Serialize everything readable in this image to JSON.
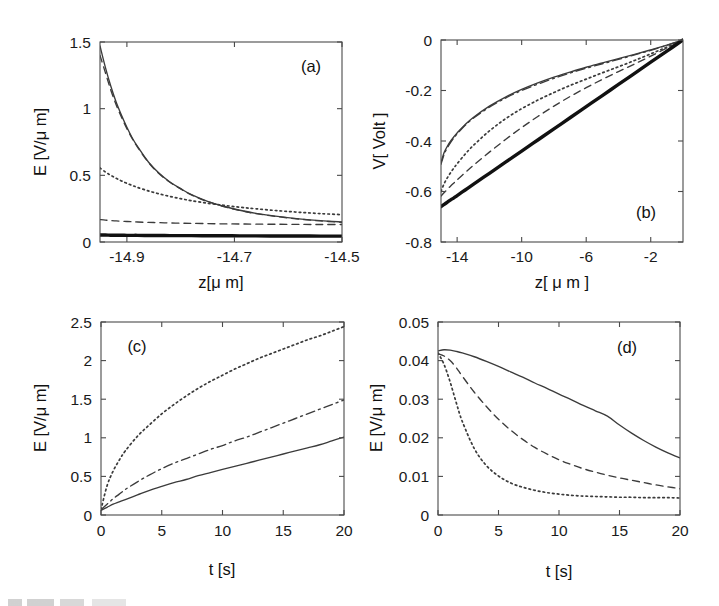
{
  "figure": {
    "background_color": "#ffffff",
    "line_color": "#3b3b3b",
    "panel_count": 4
  },
  "panels": {
    "a": {
      "tag": "(a)",
      "xlabel": "z[μ m]",
      "ylabel": "E [V/μ m]",
      "xticks": [
        "-14.9",
        "-14.7",
        "-14.5"
      ],
      "yticks": [
        "0",
        "0.5",
        "1",
        "1.5"
      ]
    },
    "b": {
      "tag": "(b)",
      "xlabel": "z[ μ m ]",
      "ylabel": "V[ Volt ]",
      "xticks": [
        "-14",
        "-10",
        "-6",
        "-2"
      ],
      "yticks": [
        "-0.8",
        "-0.6",
        "-0.4",
        "-0.2",
        "0"
      ]
    },
    "c": {
      "tag": "(c)",
      "xlabel": "t [s]",
      "ylabel": "E [V/μ m]",
      "xticks": [
        "0",
        "5",
        "10",
        "15",
        "20"
      ],
      "yticks": [
        "0",
        "0.5",
        "1",
        "1.5",
        "2",
        "2.5"
      ]
    },
    "d": {
      "tag": "(d)",
      "xlabel": "t [s]",
      "ylabel": "E [V/μ m]",
      "xticks": [
        "0",
        "5",
        "10",
        "15",
        "20"
      ],
      "yticks": [
        "0",
        "0.01",
        "0.02",
        "0.03",
        "0.04",
        "0.05"
      ]
    }
  },
  "chart_data": [
    {
      "panel": "a",
      "type": "line",
      "title": "(a)",
      "xlabel": "z[μ m]",
      "ylabel": "E [V/μ m]",
      "xlim": [
        -14.95,
        -14.5
      ],
      "ylim": [
        0,
        1.5
      ],
      "xticks": [
        -14.9,
        -14.7,
        -14.5
      ],
      "yticks": [
        0,
        0.5,
        1,
        1.5
      ],
      "grid": false,
      "legend": "none",
      "x": [
        -14.95,
        -14.94,
        -14.93,
        -14.92,
        -14.91,
        -14.9,
        -14.89,
        -14.88,
        -14.86,
        -14.84,
        -14.82,
        -14.8,
        -14.78,
        -14.75,
        -14.72,
        -14.69,
        -14.66,
        -14.62,
        -14.58,
        -14.54,
        -14.5
      ],
      "series": [
        {
          "name": "curve-1-solid",
          "style": "solid",
          "values": [
            1.47,
            1.31,
            1.17,
            1.05,
            0.95,
            0.86,
            0.78,
            0.715,
            0.6,
            0.515,
            0.45,
            0.4,
            0.355,
            0.305,
            0.268,
            0.238,
            0.215,
            0.192,
            0.174,
            0.16,
            0.15
          ]
        },
        {
          "name": "curve-2-dashed",
          "style": "dashed",
          "values": [
            1.4,
            1.27,
            1.14,
            1.03,
            0.935,
            0.85,
            0.775,
            0.71,
            0.597,
            0.512,
            0.448,
            0.398,
            0.353,
            0.303,
            0.266,
            0.236,
            0.213,
            0.19,
            0.172,
            0.158,
            0.148
          ]
        },
        {
          "name": "curve-3-dotted",
          "style": "dotted",
          "values": [
            0.555,
            0.525,
            0.5,
            0.478,
            0.458,
            0.44,
            0.424,
            0.409,
            0.383,
            0.361,
            0.342,
            0.325,
            0.31,
            0.291,
            0.275,
            0.261,
            0.249,
            0.235,
            0.223,
            0.213,
            0.205
          ]
        },
        {
          "name": "curve-4-dashed-low",
          "style": "dashed",
          "values": [
            0.168,
            0.164,
            0.161,
            0.158,
            0.156,
            0.154,
            0.152,
            0.15,
            0.147,
            0.145,
            0.143,
            0.141,
            0.14,
            0.138,
            0.136,
            0.135,
            0.134,
            0.133,
            0.132,
            0.131,
            0.131
          ]
        },
        {
          "name": "curve-5-thick-solid",
          "style": "thick",
          "values": [
            0.052,
            0.052,
            0.051,
            0.051,
            0.051,
            0.05,
            0.05,
            0.05,
            0.049,
            0.049,
            0.048,
            0.048,
            0.048,
            0.047,
            0.047,
            0.046,
            0.046,
            0.045,
            0.045,
            0.044,
            0.044
          ]
        }
      ]
    },
    {
      "panel": "b",
      "type": "line",
      "title": "(b)",
      "xlabel": "z[ μ m ]",
      "ylabel": "V[ Volt ]",
      "xlim": [
        -15,
        0
      ],
      "ylim": [
        -0.8,
        0
      ],
      "xticks": [
        -14,
        -10,
        -6,
        -2
      ],
      "yticks": [
        -0.8,
        -0.6,
        -0.4,
        -0.2,
        0
      ],
      "grid": false,
      "legend": "none",
      "x": [
        -15,
        -14.8,
        -14.6,
        -14.4,
        -14.2,
        -14,
        -13.5,
        -13,
        -12,
        -11,
        -10,
        -9,
        -8,
        -7,
        -6,
        -5,
        -4,
        -3,
        -2,
        -1,
        0
      ],
      "series": [
        {
          "name": "curve-1-solid",
          "style": "solid",
          "values": [
            -0.485,
            -0.445,
            -0.42,
            -0.4,
            -0.383,
            -0.368,
            -0.335,
            -0.307,
            -0.262,
            -0.226,
            -0.196,
            -0.17,
            -0.147,
            -0.127,
            -0.108,
            -0.091,
            -0.074,
            -0.057,
            -0.039,
            -0.02,
            0.0
          ]
        },
        {
          "name": "curve-2-dashdot",
          "style": "dashdot",
          "values": [
            -0.492,
            -0.452,
            -0.426,
            -0.405,
            -0.388,
            -0.372,
            -0.338,
            -0.31,
            -0.266,
            -0.23,
            -0.2,
            -0.175,
            -0.152,
            -0.131,
            -0.112,
            -0.094,
            -0.077,
            -0.059,
            -0.041,
            -0.021,
            0.0
          ]
        },
        {
          "name": "curve-3-dotted",
          "style": "dotted",
          "values": [
            -0.6,
            -0.568,
            -0.545,
            -0.525,
            -0.507,
            -0.49,
            -0.452,
            -0.418,
            -0.36,
            -0.312,
            -0.272,
            -0.238,
            -0.208,
            -0.18,
            -0.155,
            -0.13,
            -0.106,
            -0.081,
            -0.055,
            -0.028,
            0.0
          ]
        },
        {
          "name": "curve-4-dashed",
          "style": "dashed",
          "values": [
            -0.618,
            -0.604,
            -0.591,
            -0.578,
            -0.566,
            -0.554,
            -0.525,
            -0.497,
            -0.444,
            -0.394,
            -0.347,
            -0.303,
            -0.262,
            -0.224,
            -0.189,
            -0.156,
            -0.125,
            -0.095,
            -0.064,
            -0.032,
            0.0
          ]
        },
        {
          "name": "curve-5-thick-solid",
          "style": "thick",
          "values": [
            -0.66,
            -0.651,
            -0.642,
            -0.633,
            -0.625,
            -0.616,
            -0.594,
            -0.572,
            -0.528,
            -0.484,
            -0.44,
            -0.396,
            -0.352,
            -0.308,
            -0.264,
            -0.22,
            -0.176,
            -0.132,
            -0.088,
            -0.044,
            0.0
          ]
        }
      ]
    },
    {
      "panel": "c",
      "type": "line",
      "title": "(c)",
      "xlabel": "t [s]",
      "ylabel": "E [V/μ m]",
      "xlim": [
        0,
        20
      ],
      "ylim": [
        0,
        2.5
      ],
      "xticks": [
        0,
        5,
        10,
        15,
        20
      ],
      "yticks": [
        0,
        0.5,
        1,
        1.5,
        2,
        2.5
      ],
      "grid": false,
      "legend": "none",
      "x": [
        0,
        0.5,
        1,
        1.5,
        2,
        3,
        4,
        5,
        6,
        7,
        8,
        9,
        10,
        11,
        12,
        13,
        14,
        15,
        16,
        17,
        18,
        19,
        20
      ],
      "series": [
        {
          "name": "curve-1-dotted",
          "style": "dotted",
          "values": [
            0.07,
            0.38,
            0.57,
            0.71,
            0.83,
            1.02,
            1.17,
            1.31,
            1.43,
            1.54,
            1.64,
            1.73,
            1.81,
            1.89,
            1.96,
            2.03,
            2.09,
            2.15,
            2.21,
            2.27,
            2.32,
            2.38,
            2.44
          ]
        },
        {
          "name": "curve-2-dashdot",
          "style": "dashdot",
          "values": [
            0.07,
            0.14,
            0.21,
            0.27,
            0.33,
            0.43,
            0.52,
            0.6,
            0.67,
            0.73,
            0.79,
            0.85,
            0.9,
            0.96,
            1.01,
            1.07,
            1.13,
            1.19,
            1.25,
            1.31,
            1.37,
            1.43,
            1.49
          ]
        },
        {
          "name": "curve-3-solid",
          "style": "solid",
          "values": [
            0.06,
            0.1,
            0.14,
            0.17,
            0.2,
            0.26,
            0.32,
            0.37,
            0.42,
            0.46,
            0.51,
            0.55,
            0.59,
            0.63,
            0.67,
            0.71,
            0.75,
            0.79,
            0.83,
            0.87,
            0.91,
            0.96,
            1.01
          ]
        }
      ]
    },
    {
      "panel": "d",
      "type": "line",
      "title": "(d)",
      "xlabel": "t [s]",
      "ylabel": "E [V/μ m]",
      "xlim": [
        0,
        20
      ],
      "ylim": [
        0,
        0.05
      ],
      "xticks": [
        0,
        5,
        10,
        15,
        20
      ],
      "yticks": [
        0,
        0.01,
        0.02,
        0.03,
        0.04,
        0.05
      ],
      "grid": false,
      "legend": "none",
      "x": [
        0,
        0.5,
        1,
        1.5,
        2,
        3,
        4,
        5,
        6,
        7,
        8,
        9,
        10,
        11,
        12,
        13,
        14,
        15,
        16,
        17,
        18,
        19,
        20
      ],
      "series": [
        {
          "name": "curve-1-solid",
          "style": "solid",
          "values": [
            0.0425,
            0.0428,
            0.0427,
            0.0424,
            0.042,
            0.041,
            0.0398,
            0.0385,
            0.0371,
            0.0357,
            0.0342,
            0.0328,
            0.0313,
            0.0299,
            0.0284,
            0.027,
            0.0256,
            0.0233,
            0.0212,
            0.0193,
            0.0176,
            0.0161,
            0.0148
          ]
        },
        {
          "name": "curve-2-dashed",
          "style": "dashed",
          "values": [
            0.0418,
            0.0412,
            0.04,
            0.0382,
            0.036,
            0.0318,
            0.0281,
            0.0248,
            0.022,
            0.0196,
            0.0175,
            0.0158,
            0.0143,
            0.0131,
            0.012,
            0.0111,
            0.0103,
            0.0096,
            0.009,
            0.0084,
            0.0078,
            0.0073,
            0.0068
          ]
        },
        {
          "name": "curve-3-dotted",
          "style": "dotted",
          "values": [
            0.042,
            0.039,
            0.0345,
            0.0292,
            0.0243,
            0.0172,
            0.0128,
            0.0101,
            0.0083,
            0.0072,
            0.0064,
            0.0058,
            0.0054,
            0.0051,
            0.0049,
            0.0048,
            0.0047,
            0.0046,
            0.0046,
            0.0045,
            0.0045,
            0.0045,
            0.0044
          ]
        }
      ]
    }
  ],
  "artifact": {
    "name": "scan-edge-artifact",
    "description": "faint partially-cropped text at bottom-left edge"
  }
}
